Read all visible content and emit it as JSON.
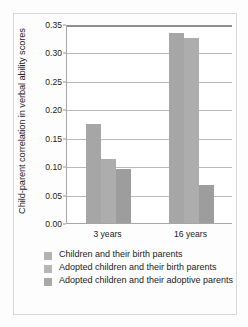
{
  "chart_data": {
    "type": "bar",
    "title": "",
    "subtitle": "",
    "xlabel": "",
    "ylabel": "Child-parent correlation in verbal ability scores",
    "categories": [
      "3 years",
      "16 years"
    ],
    "series": [
      {
        "name": "Children and their birth parents",
        "values": [
          0.175,
          0.335
        ],
        "color": "#a6a6a6"
      },
      {
        "name": "Adopted children and their birth parents",
        "values": [
          0.112,
          0.325
        ],
        "color": "#adadad"
      },
      {
        "name": "Adopted children and their adoptive parents",
        "values": [
          0.095,
          0.066
        ],
        "color": "#9d9d9d"
      }
    ],
    "ylim": [
      0.0,
      0.35
    ],
    "ytick_values": [
      0.0,
      0.05,
      0.1,
      0.15,
      0.2,
      0.25,
      0.3,
      0.35
    ],
    "ytick_labels": [
      "0.00",
      "0.05",
      "0.10",
      "0.15",
      "0.20",
      "0.25",
      "0.30",
      "0.35"
    ],
    "grid": true,
    "grid_axis": "y",
    "legend_position": "below"
  },
  "legend": {
    "items": [
      {
        "label": "Children and their birth parents",
        "swatch": "legend-swatch-series-1"
      },
      {
        "label": "Adopted children and their birth parents",
        "swatch": "legend-swatch-series-2"
      },
      {
        "label": "Adopted children and their adoptive parents",
        "swatch": "legend-swatch-series-3"
      }
    ]
  }
}
